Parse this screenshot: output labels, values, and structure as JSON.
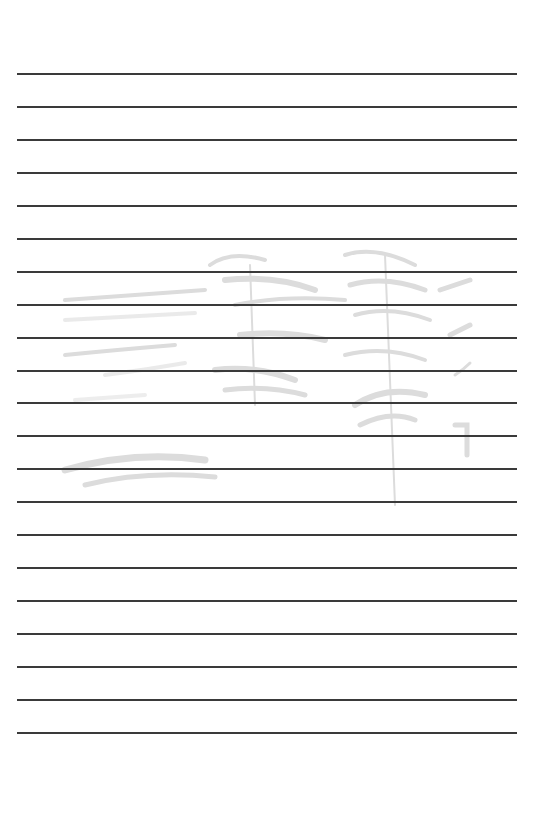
{
  "document": {
    "type": "lined-paper",
    "background_color": "#ffffff",
    "rule_color": "#3a3a3a",
    "rule_count": 21,
    "rule_left": 17,
    "rule_right": 517,
    "rule_positions_y": [
      73,
      106,
      139,
      172,
      205,
      238,
      271,
      304,
      337,
      370,
      402,
      435,
      468,
      501,
      534,
      567,
      600,
      633,
      666,
      699,
      732
    ],
    "watermark": {
      "icon": "faint-sketch-illustration",
      "color": "#d9d9d9",
      "bounds": {
        "x": 55,
        "y": 245,
        "width": 425,
        "height": 285
      }
    }
  }
}
